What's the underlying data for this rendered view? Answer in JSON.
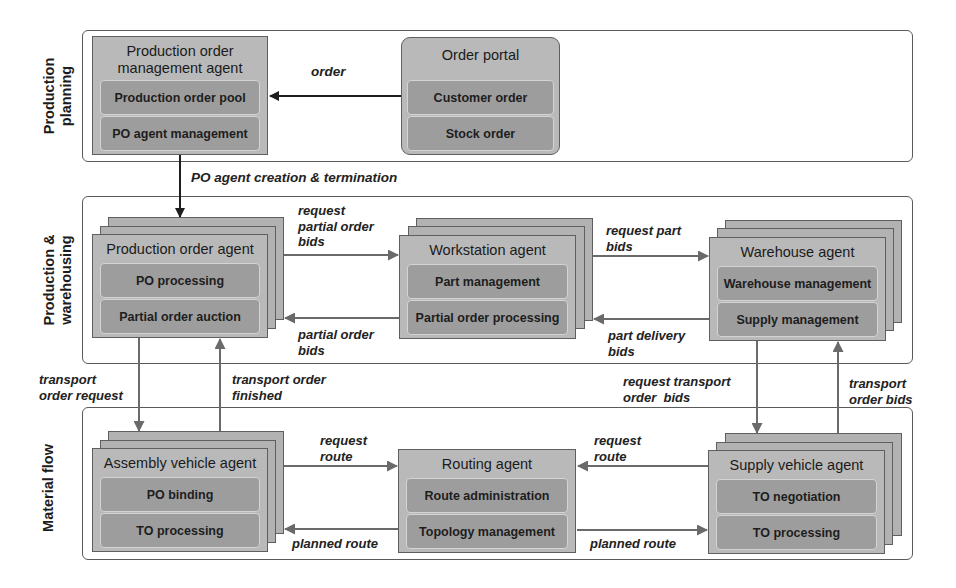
{
  "lanes": [
    {
      "id": "production-planning",
      "label": "Production planning",
      "lines": [
        "Production",
        "planning"
      ]
    },
    {
      "id": "production-warehousing",
      "label": "Production & warehousing",
      "lines": [
        "Production &",
        "warehousing"
      ]
    },
    {
      "id": "material-flow",
      "label": "Material flow",
      "lines": [
        "Material flow"
      ]
    }
  ],
  "agents": {
    "po_management": {
      "title_lines": [
        "Production order",
        "management agent"
      ],
      "modules": [
        "Production order pool",
        "PO agent management"
      ]
    },
    "order_portal": {
      "title": "Order portal",
      "modules": [
        "Customer order",
        "Stock order"
      ]
    },
    "production_order": {
      "title": "Production order agent",
      "modules": [
        "PO processing",
        "Partial order auction"
      ]
    },
    "workstation": {
      "title": "Workstation agent",
      "modules": [
        "Part management",
        "Partial order processing"
      ]
    },
    "warehouse": {
      "title": "Warehouse agent",
      "modules": [
        "Warehouse management",
        "Supply management"
      ]
    },
    "assembly_vehicle": {
      "title": "Assembly vehicle agent",
      "modules": [
        "PO binding",
        "TO processing"
      ]
    },
    "routing": {
      "title": "Routing agent",
      "modules": [
        "Route administration",
        "Topology management"
      ]
    },
    "supply_vehicle": {
      "title": "Supply vehicle agent",
      "modules": [
        "TO negotiation",
        "TO processing"
      ]
    }
  },
  "flows": {
    "order": [
      "order"
    ],
    "po_agent_creation": [
      "PO agent creation & termination"
    ],
    "request_partial_order_bids": [
      "request",
      "partial order",
      "bids"
    ],
    "partial_order_bids": [
      "partial order",
      "bids"
    ],
    "request_part_bids": [
      "request part",
      "bids"
    ],
    "part_delivery_bids": [
      "part delivery",
      "bids"
    ],
    "transport_order_request": [
      "transport",
      "order request"
    ],
    "transport_order_finished": [
      "transport order",
      "finished"
    ],
    "request_transport_order_bids": [
      "request transport",
      "order  bids"
    ],
    "transport_order_bids": [
      "transport",
      "order bids"
    ],
    "request_route_left": [
      "request",
      "route"
    ],
    "planned_route_left": [
      "planned route"
    ],
    "request_route_right": [
      "request",
      "route"
    ],
    "planned_route_right": [
      "planned route"
    ]
  },
  "colors": {
    "panel_border": "#5a5a5a",
    "box_fill": "#b9b9b9",
    "module_fill": "#9d9d9d",
    "arrow_dark": "#1e1e1e",
    "arrow_gray": "#6a6a6a"
  }
}
